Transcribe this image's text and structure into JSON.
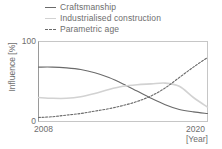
{
  "chart_data": {
    "type": "line",
    "title": "",
    "xlabel": "[Year]",
    "ylabel": "Influence [%]",
    "xlim": [
      2008,
      2020
    ],
    "ylim": [
      0,
      100
    ],
    "xticks": [
      "2008",
      "2020"
    ],
    "yticks": [
      "0",
      "100"
    ],
    "grid": false,
    "legend_position": "top-left",
    "x": [
      2008,
      2009,
      2010,
      2011,
      2012,
      2013,
      2014,
      2015,
      2016,
      2017,
      2018,
      2019,
      2020
    ],
    "series": [
      {
        "name": "Craftsmanship",
        "style": "solid",
        "color": "#6a6a6a",
        "values": [
          68,
          68,
          67,
          65,
          61,
          55,
          47,
          38,
          29,
          21,
          15,
          12,
          10
        ]
      },
      {
        "name": "Industrialised construction",
        "style": "solid",
        "color": "#d2d2d2",
        "values": [
          30,
          29,
          29,
          31,
          35,
          40,
          44,
          46,
          47,
          48,
          44,
          30,
          18
        ]
      },
      {
        "name": "Parametric age",
        "style": "dashed",
        "color": "#6a6a6a",
        "values": [
          5,
          6,
          8,
          10,
          13,
          16,
          20,
          25,
          32,
          42,
          55,
          68,
          80
        ]
      }
    ]
  },
  "legend": {
    "items": [
      {
        "label": "Craftsmanship",
        "swatch": "line-solid-dark-icon"
      },
      {
        "label": "Industrialised construction",
        "swatch": "line-solid-light-icon"
      },
      {
        "label": "Parametric age",
        "swatch": "line-dashed-dark-icon"
      }
    ]
  },
  "axes": {
    "y_label": "Influence [%]",
    "y_tick_top": "100",
    "y_tick_bottom": "0",
    "x_tick_left": "2008",
    "x_tick_right": "2020",
    "x_label": "[Year]"
  },
  "colors": {
    "dark_line": "#6a6a6a",
    "light_line": "#d2d2d2",
    "axis": "#b8b8b8",
    "text": "#6e6e6e",
    "background": "#ffffff"
  }
}
